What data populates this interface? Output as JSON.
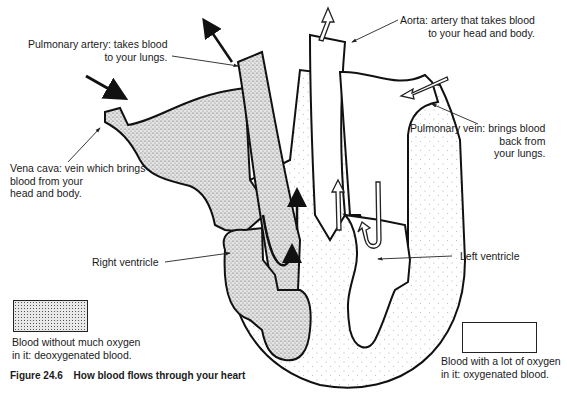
{
  "figure": {
    "number": "Figure 24.6",
    "title": "How blood flows through your heart"
  },
  "labels": {
    "pulmonary_artery": {
      "line1": "Pulmonary artery: takes blood",
      "line2": "to your lungs."
    },
    "aorta": {
      "line1": "Aorta: artery that takes blood",
      "line2": "to your head and body."
    },
    "vena_cava": {
      "line1": "Vena cava: vein which brings",
      "line2": "blood from your",
      "line3": "head and body."
    },
    "pulmonary_vein": {
      "line1": "Pulmonary vein: brings blood",
      "line2": "back from",
      "line3": "your lungs."
    },
    "right_ventricle": "Right ventricle",
    "left_ventricle": "Left ventricle"
  },
  "legend": {
    "deoxygenated": {
      "line1": "Blood without  much  oxygen",
      "line2": "in it: deoxygenated blood."
    },
    "oxygenated": {
      "line1": "Blood with a lot of oxygen",
      "line2": "in it: oxygenated blood."
    }
  },
  "colors": {
    "ink": "#1a1a1a",
    "stipple": "#e2e2e2",
    "background": "#ffffff"
  }
}
